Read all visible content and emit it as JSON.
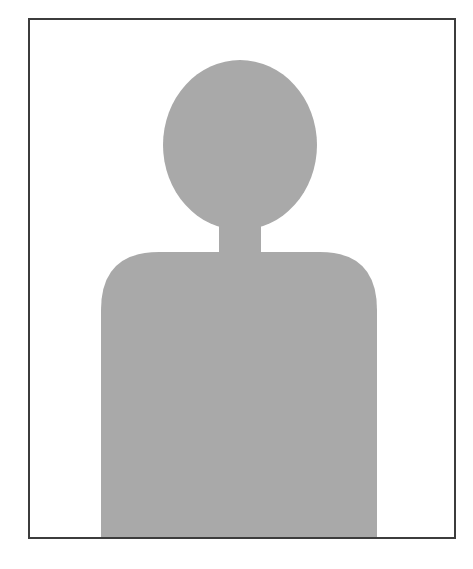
{
  "image": {
    "alt": "Default profile photo placeholder",
    "frame_color": "#3c3c3c",
    "background_color": "#ffffff",
    "silhouette_color": "#a9a9a9",
    "parts": [
      "head",
      "neck",
      "torso"
    ]
  }
}
